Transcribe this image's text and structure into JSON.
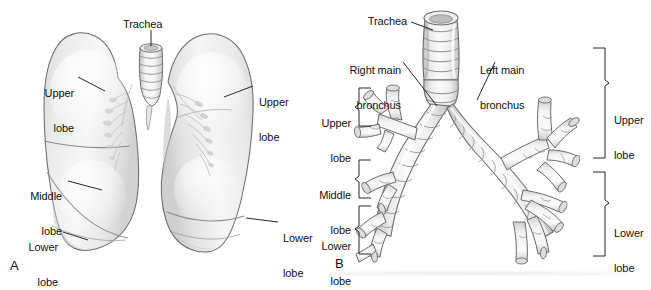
{
  "figure": {
    "background_color": "#ffffff",
    "line_color": "#111111",
    "fill_light": "#f2f2f2",
    "fill_mid": "#e3e3e3",
    "fill_shadow": "#cfcfcf"
  },
  "panels": [
    {
      "id": "A",
      "letter": "A",
      "name": "anterior-view-of-lungs",
      "labels": [
        {
          "key": "trachea",
          "text": "Trachea",
          "lines": [
            "Trachea"
          ]
        },
        {
          "key": "left_upper_lobe",
          "text": "Upper lobe",
          "lines": [
            "Upper",
            "lobe"
          ]
        },
        {
          "key": "left_middle_lobe",
          "text": "Middle lobe",
          "lines": [
            "Middle",
            "lobe"
          ]
        },
        {
          "key": "left_lower_lobe",
          "text": "Lower lobe",
          "lines": [
            "Lower",
            "lobe"
          ]
        },
        {
          "key": "right_upper_lobe",
          "text": "Upper lobe",
          "lines": [
            "Upper",
            "lobe"
          ]
        },
        {
          "key": "right_lower_lobe",
          "text": "Lower lobe",
          "lines": [
            "Lower",
            "lobe"
          ]
        }
      ]
    },
    {
      "id": "B",
      "letter": "B",
      "name": "tracheobronchial-tree",
      "labels": [
        {
          "key": "trachea",
          "text": "Trachea",
          "lines": [
            "Trachea"
          ]
        },
        {
          "key": "right_main",
          "text": "Right main bronchus",
          "lines": [
            "Right main",
            "bronchus"
          ]
        },
        {
          "key": "left_main",
          "text": "Left main bronchus",
          "lines": [
            "Left main",
            "bronchus"
          ]
        },
        {
          "key": "lt_upper_lobe",
          "text": "Upper lobe",
          "lines": [
            "Upper",
            "lobe"
          ]
        },
        {
          "key": "lt_middle_lobe",
          "text": "Middle lobe",
          "lines": [
            "Middle",
            "lobe"
          ]
        },
        {
          "key": "lt_lower_lobe",
          "text": "Lower lobe",
          "lines": [
            "Lower",
            "lobe"
          ]
        },
        {
          "key": "rt_upper_lobe",
          "text": "Upper lobe",
          "lines": [
            "Upper",
            "lobe"
          ]
        },
        {
          "key": "rt_lower_lobe",
          "text": "Lower lobe",
          "lines": [
            "Lower",
            "lobe"
          ]
        }
      ]
    }
  ],
  "panel_a": {
    "letter": "A",
    "trachea": "Trachea",
    "left_upper_1": "Upper",
    "left_upper_2": "lobe",
    "left_middle_1": "Middle",
    "left_middle_2": "lobe",
    "left_lower_1": "Lower",
    "left_lower_2": "lobe",
    "right_upper_1": "Upper",
    "right_upper_2": "lobe",
    "right_lower_1": "Lower",
    "right_lower_2": "lobe"
  },
  "panel_b": {
    "letter": "B",
    "trachea": "Trachea",
    "right_main_1": "Right main",
    "right_main_2": "bronchus",
    "left_main_1": "Left main",
    "left_main_2": "bronchus",
    "lt_upper_1": "Upper",
    "lt_upper_2": "lobe",
    "lt_middle_1": "Middle",
    "lt_middle_2": "lobe",
    "lt_lower_1": "Lower",
    "lt_lower_2": "lobe",
    "rt_upper_1": "Upper",
    "rt_upper_2": "lobe",
    "rt_lower_1": "Lower",
    "rt_lower_2": "lobe"
  }
}
